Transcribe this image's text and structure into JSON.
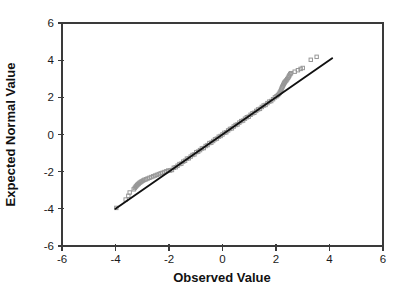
{
  "chart_data": {
    "type": "scatter",
    "title": "",
    "xlabel": "Observed Value",
    "ylabel": "Expected Normal Value",
    "xlim": [
      -6,
      6
    ],
    "ylim": [
      -6,
      6
    ],
    "xticks": [
      -6,
      -4,
      -2,
      0,
      2,
      4,
      6
    ],
    "yticks": [
      -6,
      -4,
      -2,
      0,
      2,
      4,
      6
    ],
    "grid": false,
    "legend": null,
    "marker": "open-square",
    "marker_color": "#979797",
    "frame_color": "#3a3a3a",
    "reference_line": {
      "x1": -4.0,
      "y1": -4.0,
      "x2": 4.1,
      "y2": 4.1,
      "color": "#111111"
    },
    "points": [
      [
        -3.97,
        -3.95
      ],
      [
        -3.62,
        -3.5
      ],
      [
        -3.52,
        -3.3
      ],
      [
        -3.47,
        -3.12
      ],
      [
        -3.32,
        -2.95
      ],
      [
        -3.28,
        -2.88
      ],
      [
        -3.25,
        -2.82
      ],
      [
        -3.22,
        -2.77
      ],
      [
        -3.19,
        -2.72
      ],
      [
        -3.16,
        -2.68
      ],
      [
        -3.13,
        -2.64
      ],
      [
        -3.1,
        -2.6
      ],
      [
        -3.06,
        -2.56
      ],
      [
        -3.02,
        -2.52
      ],
      [
        -2.97,
        -2.48
      ],
      [
        -2.92,
        -2.44
      ],
      [
        -2.86,
        -2.41
      ],
      [
        -2.8,
        -2.37
      ],
      [
        -2.73,
        -2.33
      ],
      [
        -2.66,
        -2.29
      ],
      [
        -2.59,
        -2.25
      ],
      [
        -2.52,
        -2.21
      ],
      [
        -2.45,
        -2.17
      ],
      [
        -2.38,
        -2.13
      ],
      [
        -2.31,
        -2.09
      ],
      [
        -2.24,
        -2.06
      ],
      [
        -2.17,
        -2.02
      ],
      [
        -2.1,
        -1.98
      ],
      [
        -2.03,
        -1.94
      ],
      [
        -1.96,
        -1.94
      ],
      [
        -1.89,
        -1.91
      ],
      [
        -1.82,
        -1.79
      ],
      [
        -1.75,
        -1.76
      ],
      [
        -1.68,
        -1.68
      ],
      [
        -1.61,
        -1.59
      ],
      [
        -1.54,
        -1.57
      ],
      [
        -1.47,
        -1.46
      ],
      [
        -1.4,
        -1.41
      ],
      [
        -1.33,
        -1.3
      ],
      [
        -1.26,
        -1.28
      ],
      [
        -1.19,
        -1.19
      ],
      [
        -1.12,
        -1.1
      ],
      [
        -1.05,
        -1.07
      ],
      [
        -0.98,
        -0.95
      ],
      [
        -0.91,
        -0.92
      ],
      [
        -0.84,
        -0.84
      ],
      [
        -0.77,
        -0.75
      ],
      [
        -0.7,
        -0.73
      ],
      [
        -0.63,
        -0.62
      ],
      [
        -0.56,
        -0.57
      ],
      [
        -0.49,
        -0.46
      ],
      [
        -0.42,
        -0.44
      ],
      [
        -0.35,
        -0.35
      ],
      [
        -0.28,
        -0.26
      ],
      [
        -0.21,
        -0.22
      ],
      [
        -0.14,
        -0.12
      ],
      [
        -0.07,
        -0.08
      ],
      [
        0.0,
        0.0
      ],
      [
        0.07,
        0.09
      ],
      [
        0.14,
        0.12
      ],
      [
        0.21,
        0.22
      ],
      [
        0.28,
        0.3
      ],
      [
        0.35,
        0.33
      ],
      [
        0.42,
        0.43
      ],
      [
        0.49,
        0.51
      ],
      [
        0.56,
        0.54
      ],
      [
        0.63,
        0.64
      ],
      [
        0.7,
        0.72
      ],
      [
        0.77,
        0.75
      ],
      [
        0.84,
        0.85
      ],
      [
        0.91,
        0.93
      ],
      [
        0.98,
        0.96
      ],
      [
        1.05,
        1.06
      ],
      [
        1.12,
        1.14
      ],
      [
        1.19,
        1.17
      ],
      [
        1.26,
        1.27
      ],
      [
        1.33,
        1.35
      ],
      [
        1.4,
        1.38
      ],
      [
        1.47,
        1.48
      ],
      [
        1.54,
        1.56
      ],
      [
        1.61,
        1.59
      ],
      [
        1.68,
        1.69
      ],
      [
        1.75,
        1.77
      ],
      [
        1.82,
        1.8
      ],
      [
        1.89,
        1.9
      ],
      [
        1.96,
        2.0
      ],
      [
        2.02,
        2.06
      ],
      [
        2.07,
        2.12
      ],
      [
        2.11,
        2.18
      ],
      [
        2.14,
        2.25
      ],
      [
        2.17,
        2.32
      ],
      [
        2.19,
        2.4
      ],
      [
        2.21,
        2.47
      ],
      [
        2.23,
        2.54
      ],
      [
        2.25,
        2.6
      ],
      [
        2.27,
        2.66
      ],
      [
        2.29,
        2.72
      ],
      [
        2.31,
        2.77
      ],
      [
        2.33,
        2.82
      ],
      [
        2.36,
        2.87
      ],
      [
        2.39,
        2.92
      ],
      [
        2.42,
        2.98
      ],
      [
        2.45,
        3.05
      ],
      [
        2.48,
        3.12
      ],
      [
        2.5,
        3.18
      ],
      [
        2.53,
        3.25
      ],
      [
        2.56,
        3.3
      ],
      [
        2.7,
        3.38
      ],
      [
        2.82,
        3.46
      ],
      [
        2.92,
        3.53
      ],
      [
        3.0,
        3.58
      ],
      [
        3.3,
        4.02
      ],
      [
        3.52,
        4.18
      ]
    ]
  }
}
